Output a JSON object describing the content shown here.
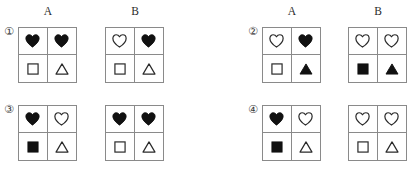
{
  "page": {
    "columns": [
      "A",
      "B"
    ],
    "colors": {
      "grid_line": "#8a8a8a",
      "shape_fill": "#111111",
      "shape_stroke": "#2a2a2a",
      "background": "#ffffff",
      "text": "#2b2b2b"
    }
  },
  "items": [
    {
      "index_label": "①",
      "index_name": "item-1",
      "grids": [
        {
          "column": "A",
          "cells": [
            {
              "shape": "heart",
              "fill": "filled"
            },
            {
              "shape": "heart",
              "fill": "filled"
            },
            {
              "shape": "square",
              "fill": "outline"
            },
            {
              "shape": "triangle",
              "fill": "outline"
            }
          ]
        },
        {
          "column": "B",
          "cells": [
            {
              "shape": "heart",
              "fill": "outline"
            },
            {
              "shape": "heart",
              "fill": "filled"
            },
            {
              "shape": "square",
              "fill": "outline"
            },
            {
              "shape": "triangle",
              "fill": "outline"
            }
          ]
        }
      ]
    },
    {
      "index_label": "②",
      "index_name": "item-2",
      "grids": [
        {
          "column": "A",
          "cells": [
            {
              "shape": "heart",
              "fill": "outline"
            },
            {
              "shape": "heart",
              "fill": "filled"
            },
            {
              "shape": "square",
              "fill": "outline"
            },
            {
              "shape": "triangle",
              "fill": "filled"
            }
          ]
        },
        {
          "column": "B",
          "cells": [
            {
              "shape": "heart",
              "fill": "outline"
            },
            {
              "shape": "heart",
              "fill": "outline"
            },
            {
              "shape": "square",
              "fill": "filled"
            },
            {
              "shape": "triangle",
              "fill": "filled"
            }
          ]
        }
      ]
    },
    {
      "index_label": "③",
      "index_name": "item-3",
      "grids": [
        {
          "column": "A",
          "cells": [
            {
              "shape": "heart",
              "fill": "filled"
            },
            {
              "shape": "heart",
              "fill": "outline"
            },
            {
              "shape": "square",
              "fill": "filled"
            },
            {
              "shape": "triangle",
              "fill": "outline"
            }
          ]
        },
        {
          "column": "B",
          "cells": [
            {
              "shape": "heart",
              "fill": "filled"
            },
            {
              "shape": "heart",
              "fill": "filled"
            },
            {
              "shape": "square",
              "fill": "outline"
            },
            {
              "shape": "triangle",
              "fill": "outline"
            }
          ]
        }
      ]
    },
    {
      "index_label": "④",
      "index_name": "item-4",
      "grids": [
        {
          "column": "A",
          "cells": [
            {
              "shape": "heart",
              "fill": "filled"
            },
            {
              "shape": "heart",
              "fill": "outline"
            },
            {
              "shape": "square",
              "fill": "filled"
            },
            {
              "shape": "triangle",
              "fill": "outline"
            }
          ]
        },
        {
          "column": "B",
          "cells": [
            {
              "shape": "heart",
              "fill": "outline"
            },
            {
              "shape": "heart",
              "fill": "outline"
            },
            {
              "shape": "square",
              "fill": "outline"
            },
            {
              "shape": "triangle",
              "fill": "outline"
            }
          ]
        }
      ]
    }
  ]
}
